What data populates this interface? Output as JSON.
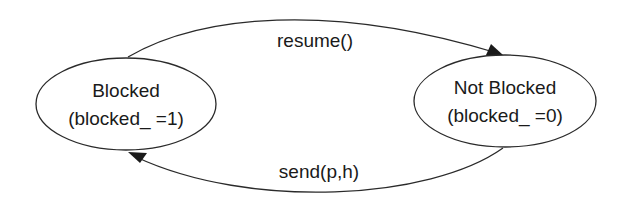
{
  "diagram": {
    "type": "state-transition",
    "states": [
      {
        "id": "blocked",
        "name": "Blocked",
        "detail": "(blocked_ =1)"
      },
      {
        "id": "not_blocked",
        "name": "Not Blocked",
        "detail": "(blocked_ =0)"
      }
    ],
    "transitions": [
      {
        "from": "blocked",
        "to": "not_blocked",
        "label": "resume()"
      },
      {
        "from": "not_blocked",
        "to": "blocked",
        "label": "send(p,h)"
      }
    ]
  }
}
